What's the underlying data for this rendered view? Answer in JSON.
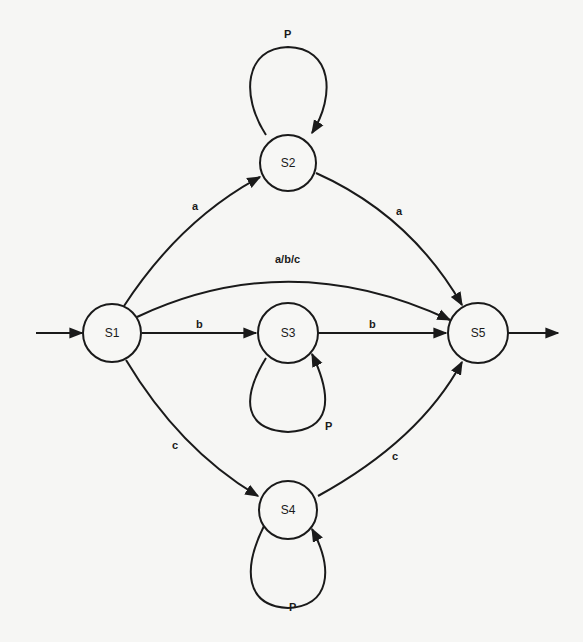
{
  "diagram": {
    "type": "state-transition-diagram",
    "states": [
      {
        "id": "S1",
        "label": "S1",
        "role": "initial"
      },
      {
        "id": "S2",
        "label": "S2"
      },
      {
        "id": "S3",
        "label": "S3"
      },
      {
        "id": "S4",
        "label": "S4"
      },
      {
        "id": "S5",
        "label": "S5",
        "role": "final"
      }
    ],
    "transitions": [
      {
        "from": "S1",
        "to": "S2",
        "label": "a"
      },
      {
        "from": "S2",
        "to": "S5",
        "label": "a"
      },
      {
        "from": "S1",
        "to": "S5",
        "label": "a/b/c"
      },
      {
        "from": "S1",
        "to": "S3",
        "label": "b"
      },
      {
        "from": "S3",
        "to": "S5",
        "label": "b"
      },
      {
        "from": "S1",
        "to": "S4",
        "label": "c"
      },
      {
        "from": "S4",
        "to": "S5",
        "label": "c"
      },
      {
        "from": "S2",
        "to": "S2",
        "label": "P"
      },
      {
        "from": "S3",
        "to": "S3",
        "label": "P"
      },
      {
        "from": "S4",
        "to": "S4",
        "label": "P"
      }
    ],
    "entry_arrow": {
      "to": "S1"
    },
    "exit_arrow": {
      "from": "S5"
    }
  }
}
